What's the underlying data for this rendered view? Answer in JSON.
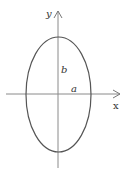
{
  "diagram": {
    "type": "ellipse-on-axes",
    "axes": {
      "x_label": "x",
      "y_label": "y"
    },
    "ellipse": {
      "semi_major_label": "b",
      "semi_minor_label": "a",
      "orientation": "vertical major axis"
    },
    "colors": {
      "stroke": "#555555",
      "axis": "#888888",
      "text": "#333333"
    }
  }
}
